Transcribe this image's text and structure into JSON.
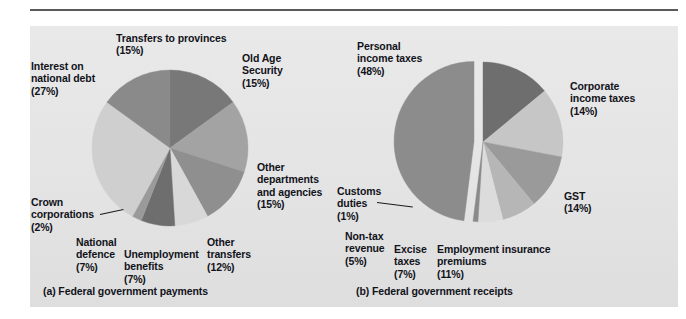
{
  "figure": {
    "background_color": "#e6e6e6",
    "page_color": "#ffffff",
    "rule_color": "#5a5a5a"
  },
  "captions": {
    "a": "(a) Federal government payments",
    "b": "(b) Federal government receipts"
  },
  "labels": {
    "a": {
      "transfers_to_provinces": "Transfers to provinces",
      "transfers_to_provinces_pct": "(15%)",
      "interest_on_national_debt_1": "Interest on",
      "interest_on_national_debt_2": "national debt",
      "interest_on_national_debt_pct": "(27%)",
      "old_age_security_1": "Old Age",
      "old_age_security_2": "Security",
      "old_age_security_pct": "(15%)",
      "other_departments_1": "Other",
      "other_departments_2": "departments",
      "other_departments_3": "and agencies",
      "other_departments_pct": "(15%)",
      "other_transfers_1": "Other",
      "other_transfers_2": "transfers",
      "other_transfers_pct": "(12%)",
      "unemployment_benefits_1": "Unemployment",
      "unemployment_benefits_2": "benefits",
      "unemployment_benefits_pct": "(7%)",
      "national_defence_1": "National",
      "national_defence_2": "defence",
      "national_defence_pct": "(7%)",
      "crown_corporations_1": "Crown",
      "crown_corporations_2": "corporations",
      "crown_corporations_pct": "(2%)"
    },
    "b": {
      "personal_income_taxes_1": "Personal",
      "personal_income_taxes_2": "income taxes",
      "personal_income_taxes_pct": "(48%)",
      "corporate_income_taxes_1": "Corporate",
      "corporate_income_taxes_2": "income taxes",
      "corporate_income_taxes_pct": "(14%)",
      "gst": "GST",
      "gst_pct": "(14%)",
      "employment_insurance_1": "Employment insurance",
      "employment_insurance_2": "premiums",
      "employment_insurance_pct": "(11%)",
      "excise_taxes_1": "Excise",
      "excise_taxes_2": "taxes",
      "excise_taxes_pct": "(7%)",
      "non_tax_revenue_1": "Non-tax",
      "non_tax_revenue_2": "revenue",
      "non_tax_revenue_pct": "(5%)",
      "customs_duties_1": "Customs",
      "customs_duties_2": "duties",
      "customs_duties_pct": "(1%)"
    }
  },
  "chart_data": [
    {
      "type": "pie",
      "title": "(a) Federal government payments",
      "center": [
        170,
        148
      ],
      "radius": 78,
      "start_angle_deg": -90,
      "direction": "clockwise",
      "legend": "labels-outside",
      "grid": false,
      "categories": [
        "Old Age Security",
        "Other departments and agencies",
        "Other transfers",
        "Unemployment benefits",
        "National defence",
        "Crown corporations",
        "Interest on national debt",
        "Transfers to provinces"
      ],
      "values": [
        15,
        15,
        12,
        7,
        7,
        2,
        27,
        15
      ],
      "unit": "percent",
      "colors": [
        "#787878",
        "#a3a3a3",
        "#8f8f8f",
        "#d8d8d8",
        "#6e6e6e",
        "#9a9a9a",
        "#cfcfcf",
        "#8a8a8a"
      ]
    },
    {
      "type": "pie",
      "title": "(b) Federal government receipts",
      "center": [
        483,
        142
      ],
      "radius": 80,
      "start_angle_deg": -90,
      "direction": "clockwise",
      "exploded_slice": "Personal income taxes",
      "legend": "labels-outside",
      "grid": false,
      "categories": [
        "Corporate income taxes",
        "GST",
        "Employment insurance premiums",
        "Excise taxes",
        "Non-tax revenue",
        "Customs duties",
        "Personal income taxes"
      ],
      "values": [
        14,
        14,
        11,
        7,
        5,
        1,
        48
      ],
      "unit": "percent",
      "colors": [
        "#6e6e6e",
        "#c6c6c6",
        "#9a9a9a",
        "#b6b6b6",
        "#dcdcdc",
        "#8a8a8a",
        "#8c8c8c"
      ]
    }
  ]
}
